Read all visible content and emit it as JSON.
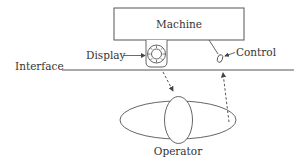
{
  "diagram": {
    "machine": {
      "label": "Machine"
    },
    "display": {
      "label": "Display"
    },
    "control": {
      "label": "Control"
    },
    "interface": {
      "label": "Interface"
    },
    "operator": {
      "label": "Operator"
    },
    "colors": {
      "stroke": "#555555",
      "text": "#333333",
      "background": "#ffffff"
    }
  }
}
